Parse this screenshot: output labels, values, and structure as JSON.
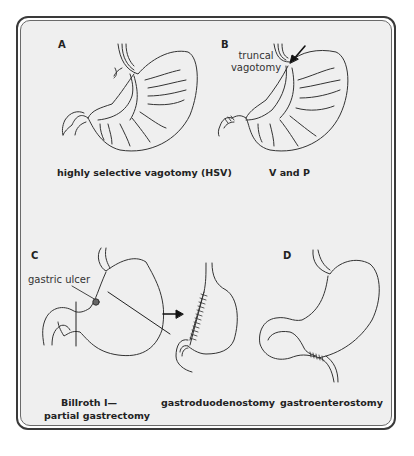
{
  "figure": {
    "panels": [
      {
        "id": "A",
        "letter": "A",
        "caption": "highly selective vagotomy (HSV)"
      },
      {
        "id": "B",
        "letter": "B",
        "caption": "V and P",
        "annotation_line1": "truncal",
        "annotation_line2": "vagotomy"
      },
      {
        "id": "C",
        "letter": "C",
        "caption_line1": "Billroth I—",
        "caption_line2": "partial gastrectomy",
        "annotation": "gastric ulcer",
        "result_caption": "gastroduodenostomy"
      },
      {
        "id": "D",
        "letter": "D",
        "caption": "gastroenterostomy"
      }
    ],
    "colors": {
      "frame": "#3a3a3a",
      "background": "#efefef",
      "line": "#333333"
    }
  }
}
